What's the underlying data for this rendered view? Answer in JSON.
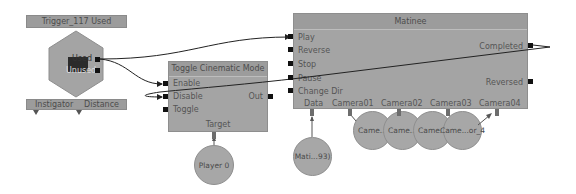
{
  "colors": {
    "node_body": "#a4a4a4",
    "node_title": "#9c9c9c",
    "port": "#111111",
    "wire": "#222222",
    "background": "#ffffff"
  },
  "trigger_node": {
    "title": "Trigger_117 Used",
    "outputs": [
      "Used",
      "Unused"
    ],
    "variables": [
      "Instigator",
      "Distance"
    ]
  },
  "toggle_node": {
    "title": "Toggle Cinematic Mode",
    "inputs": [
      "Enable",
      "Disable",
      "Toggle"
    ],
    "outputs": [
      "Out"
    ],
    "variables": [
      "Target"
    ]
  },
  "matinee_node": {
    "title": "Matinee",
    "inputs": [
      "Play",
      "Reverse",
      "Stop",
      "Pause",
      "Change Dir"
    ],
    "outputs": [
      "Completed",
      "Reversed"
    ],
    "variables": [
      "Data",
      "Camera01",
      "Camera02",
      "Camera03",
      "Camera04"
    ]
  },
  "variables": {
    "player": "Player 0",
    "matinee_data": "Mati...93)",
    "cameras": [
      "Came...",
      "Came...",
      "Came...",
      "Came...or_4"
    ]
  }
}
